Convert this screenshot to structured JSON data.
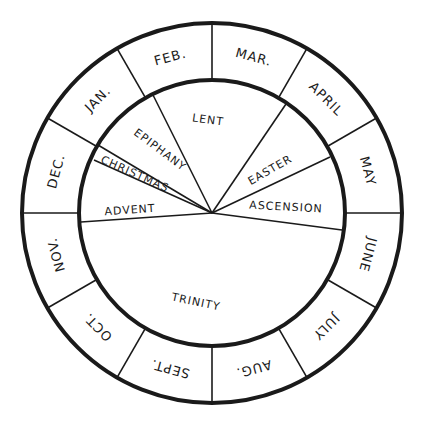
{
  "diagram": {
    "type": "liturgical-year-wheel",
    "center": [
      212,
      213
    ],
    "outer_radius": 190,
    "inner_radius": 133,
    "stroke_color": "#1a1a1a",
    "background": "#ffffff",
    "months": [
      {
        "label": "MAR.",
        "mid_angle": 285
      },
      {
        "label": "APRIL",
        "mid_angle": 315
      },
      {
        "label": "MAY",
        "mid_angle": 345
      },
      {
        "label": "JUNE",
        "mid_angle": 15
      },
      {
        "label": "JULY",
        "mid_angle": 45
      },
      {
        "label": "AUG.",
        "mid_angle": 75
      },
      {
        "label": "SEPT.",
        "mid_angle": 105
      },
      {
        "label": "OCT.",
        "mid_angle": 135
      },
      {
        "label": "NOV.",
        "mid_angle": 165
      },
      {
        "label": "DEC.",
        "mid_angle": 195
      },
      {
        "label": "JAN.",
        "mid_angle": 225
      },
      {
        "label": "FEB.",
        "mid_angle": 255
      }
    ],
    "month_divider_angles": [
      0,
      30,
      60,
      90,
      120,
      150,
      180,
      210,
      240,
      270,
      300,
      330
    ],
    "season_dividers": [
      {
        "between": "Lent/Epiphany",
        "end": [
          152,
          93
        ]
      },
      {
        "between": "Epiphany/Christmas",
        "end": [
          98,
          145
        ]
      },
      {
        "between": "Christmas/Advent",
        "end": [
          94,
          160
        ]
      },
      {
        "between": "Advent/Trinity",
        "end": [
          81,
          222
        ]
      },
      {
        "between": "Lent/Easter",
        "end": [
          286,
          104
        ]
      },
      {
        "between": "Easter/Ascension",
        "end": [
          330,
          157
        ]
      },
      {
        "between": "Ascension/Trinity",
        "end": [
          342,
          230
        ]
      }
    ],
    "seasons": [
      {
        "label": "LENT",
        "x": 208,
        "y": 120,
        "rotate": 8
      },
      {
        "label": "EPIPHANY",
        "x": 160,
        "y": 150,
        "rotate": 37
      },
      {
        "label": "CHRISTMAS",
        "x": 135,
        "y": 174,
        "rotate": 24
      },
      {
        "label": "ADVENT",
        "x": 130,
        "y": 210,
        "rotate": -4
      },
      {
        "label": "EASTER",
        "x": 270,
        "y": 170,
        "rotate": -30
      },
      {
        "label": "ASCENSION",
        "x": 286,
        "y": 207,
        "rotate": 3
      },
      {
        "label": "TRINITY",
        "x": 196,
        "y": 302,
        "rotate": 12
      }
    ]
  }
}
